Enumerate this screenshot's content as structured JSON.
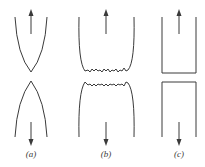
{
  "figure": {
    "panels": [
      {
        "id": "a",
        "label": "(a)",
        "shape": "necked to a point (ductile rupture)"
      },
      {
        "id": "b",
        "label": "(b)",
        "shape": "cup-and-cone with rough fracture surface"
      },
      {
        "id": "c",
        "label": "(c)",
        "shape": "flat brittle fracture"
      }
    ],
    "colors": {
      "stroke": "#3a3a3a",
      "background": "#ffffff"
    }
  }
}
